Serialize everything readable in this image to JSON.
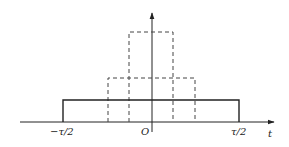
{
  "diagram": {
    "type": "rectangular-pulses",
    "axes": {
      "x_label": "t",
      "origin_label": "O"
    },
    "tick_labels": {
      "left": "−τ/2",
      "right": "τ/2"
    },
    "pulses": [
      {
        "style": "solid",
        "description": "wide pulse of width τ, lowest height"
      },
      {
        "style": "dashed",
        "description": "narrower pulse, medium height"
      },
      {
        "style": "dashed",
        "description": "narrowest pulse, tallest height"
      }
    ],
    "colors": {
      "line": "#222222",
      "background": "#ffffff"
    }
  }
}
